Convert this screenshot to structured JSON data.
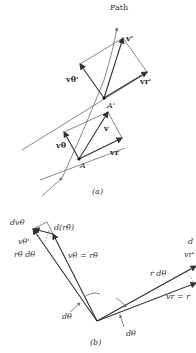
{
  "figure": {
    "part_a": {
      "caption": "(a)",
      "path_label": "Path",
      "point_A": "A",
      "point_A_prime": "A'",
      "vectors": {
        "v": "v",
        "v_theta": "vθ",
        "v_r": "vr",
        "v_prime": "v'",
        "v_theta_prime": "vθ'",
        "v_r_prime": "vr'"
      }
    },
    "part_b": {
      "caption": "(b)",
      "labels": {
        "d_v_theta": "dvθ",
        "d_r_theta_dot": "d(rθ̇)",
        "v_theta_prime": "vθ'",
        "r_theta_dot_dtheta": "rθ̇ dθ",
        "v_theta_eq": "vθ = rθ̇",
        "dtheta_left": "dθ",
        "dtheta_right": "dθ",
        "r_dot_dtheta": "ṙ dθ",
        "v_r_prime": "vr'",
        "v_r_eq": "vr = ṙ",
        "d_v_r_partial": "d"
      }
    }
  }
}
